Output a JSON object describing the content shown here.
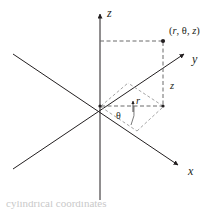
{
  "figure": {
    "name": "cylindrical-coordinates-diagram",
    "background_color": "#ffffff",
    "line_color": "#231f20",
    "dashed_color": "#6b6b6b",
    "axes": [
      {
        "id": "z",
        "label": "z",
        "direction": "up"
      },
      {
        "id": "y",
        "label": "y",
        "direction": "up-right"
      },
      {
        "id": "x",
        "label": "x",
        "direction": "down-right"
      }
    ],
    "point": {
      "label_open": "(",
      "label_r": "r",
      "label_sep1": ", ",
      "label_theta": "θ",
      "label_sep2": ", ",
      "label_z": "z",
      "label_close": ")",
      "full_label": "(r, θ, z)"
    },
    "measurements": [
      {
        "id": "z-height",
        "label": "z"
      },
      {
        "id": "radius",
        "label": "r"
      },
      {
        "id": "angle",
        "label": "θ"
      }
    ],
    "caption": "cylindrical coordinates"
  }
}
